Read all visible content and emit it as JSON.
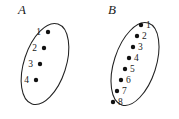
{
  "figure": {
    "type": "set-diagram",
    "background_color": "#ffffff",
    "stroke_color": "#222222",
    "dot_color": "#111111",
    "text_color": "#1a1a1a",
    "sets": [
      {
        "name": "A",
        "label": "A",
        "label_pos": {
          "x": 22,
          "y": 14
        },
        "ellipse": {
          "cx": 45,
          "cy": 64,
          "rx": 21,
          "ry": 42,
          "rotation": 18
        },
        "label_side": "left",
        "elements": [
          {
            "label": "1",
            "dot_x": 48,
            "dot_y": 32,
            "text_x": 41,
            "text_y": 35
          },
          {
            "label": "2",
            "dot_x": 44,
            "dot_y": 48,
            "text_x": 37,
            "text_y": 51
          },
          {
            "label": "3",
            "dot_x": 40,
            "dot_y": 64,
            "text_x": 33,
            "text_y": 67
          },
          {
            "label": "4",
            "dot_x": 36,
            "dot_y": 80,
            "text_x": 29,
            "text_y": 83
          }
        ]
      },
      {
        "name": "B",
        "label": "B",
        "label_pos": {
          "x": 112,
          "y": 14
        },
        "ellipse": {
          "cx": 135,
          "cy": 64,
          "rx": 21,
          "ry": 43,
          "rotation": 18
        },
        "label_side": "right",
        "elements": [
          {
            "label": "1",
            "dot_x": 141,
            "dot_y": 25,
            "text_x": 146,
            "text_y": 28
          },
          {
            "label": "2",
            "dot_x": 137,
            "dot_y": 36,
            "text_x": 142,
            "text_y": 39
          },
          {
            "label": "3",
            "dot_x": 133,
            "dot_y": 47,
            "text_x": 138,
            "text_y": 50
          },
          {
            "label": "4",
            "dot_x": 129,
            "dot_y": 58,
            "text_x": 134,
            "text_y": 61
          },
          {
            "label": "5",
            "dot_x": 125,
            "dot_y": 69,
            "text_x": 130,
            "text_y": 72
          },
          {
            "label": "6",
            "dot_x": 121,
            "dot_y": 80,
            "text_x": 126,
            "text_y": 83
          },
          {
            "label": "7",
            "dot_x": 117,
            "dot_y": 91,
            "text_x": 122,
            "text_y": 94
          },
          {
            "label": "8",
            "dot_x": 113,
            "dot_y": 102,
            "text_x": 118,
            "text_y": 105
          }
        ]
      }
    ],
    "dot_radius": 2.2
  }
}
